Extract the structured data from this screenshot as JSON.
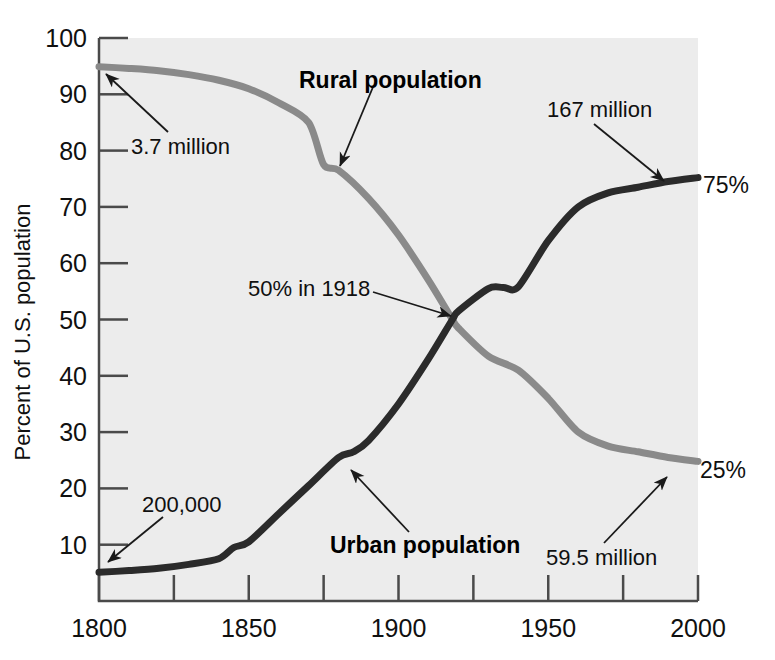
{
  "chart_data": {
    "type": "line",
    "title": "",
    "xlabel": "",
    "ylabel": "Percent of U.S. population",
    "xlim": [
      1800,
      2000
    ],
    "ylim": [
      0,
      100
    ],
    "xticks": [
      1800,
      1825,
      1850,
      1875,
      1900,
      1925,
      1950,
      1975,
      2000
    ],
    "xtick_labels": [
      "1800",
      "",
      "1850",
      "",
      "1900",
      "",
      "1950",
      "",
      "2000"
    ],
    "yticks": [
      10,
      20,
      30,
      40,
      50,
      60,
      70,
      80,
      90,
      100
    ],
    "ytick_labels": [
      "10",
      "20",
      "30",
      "40",
      "50",
      "60",
      "70",
      "80",
      "90",
      "100"
    ],
    "grid": false,
    "legend": "inline-labels",
    "background": "#ececec",
    "series": [
      {
        "name": "Rural population",
        "color": "#8a8a8a",
        "x": [
          1800,
          1810,
          1820,
          1830,
          1840,
          1850,
          1860,
          1870,
          1875,
          1880,
          1890,
          1900,
          1910,
          1918,
          1920,
          1930,
          1940,
          1950,
          1960,
          1970,
          1980,
          1990,
          2000
        ],
        "values": [
          94.9,
          94.6,
          94.2,
          93.5,
          92.5,
          91.0,
          88.5,
          85.0,
          77.5,
          76.5,
          71.5,
          65.0,
          57.0,
          50.0,
          48.5,
          43.5,
          41.0,
          36.0,
          30.0,
          27.5,
          26.5,
          25.5,
          24.8
        ]
      },
      {
        "name": "Urban population",
        "color": "#2b2b2b",
        "x": [
          1800,
          1810,
          1820,
          1830,
          1840,
          1845,
          1850,
          1860,
          1870,
          1880,
          1885,
          1890,
          1900,
          1910,
          1918,
          1920,
          1930,
          1935,
          1940,
          1950,
          1960,
          1970,
          1980,
          1990,
          2000
        ],
        "values": [
          5.1,
          5.4,
          5.8,
          6.5,
          7.5,
          9.5,
          10.5,
          15.5,
          20.5,
          25.5,
          26.5,
          28.5,
          35.0,
          43.0,
          50.0,
          51.5,
          55.5,
          55.7,
          55.8,
          64.0,
          70.0,
          72.5,
          73.5,
          74.5,
          75.2
        ]
      }
    ],
    "annotations": [
      {
        "id": "rural-series-label",
        "text": "Rural population",
        "kind": "series-label"
      },
      {
        "id": "urban-series-label",
        "text": "Urban population",
        "kind": "series-label"
      },
      {
        "id": "urban-start-value",
        "text": "200,000",
        "kind": "callout"
      },
      {
        "id": "rural-start-value",
        "text": "3.7 million",
        "kind": "callout"
      },
      {
        "id": "crossover-value",
        "text": "50% in 1918",
        "kind": "callout"
      },
      {
        "id": "urban-end-value",
        "text": "167 million",
        "kind": "callout"
      },
      {
        "id": "rural-end-value",
        "text": "59.5 million",
        "kind": "callout"
      },
      {
        "id": "urban-end-percent",
        "text": "75%",
        "kind": "endpoint"
      },
      {
        "id": "rural-end-percent",
        "text": "25%",
        "kind": "endpoint"
      }
    ]
  },
  "colors": {
    "rural_line": "#8a8a8a",
    "urban_line": "#2b2b2b",
    "plot_background": "#ececec",
    "axis": "#4a4a4a",
    "text": "#101010"
  }
}
